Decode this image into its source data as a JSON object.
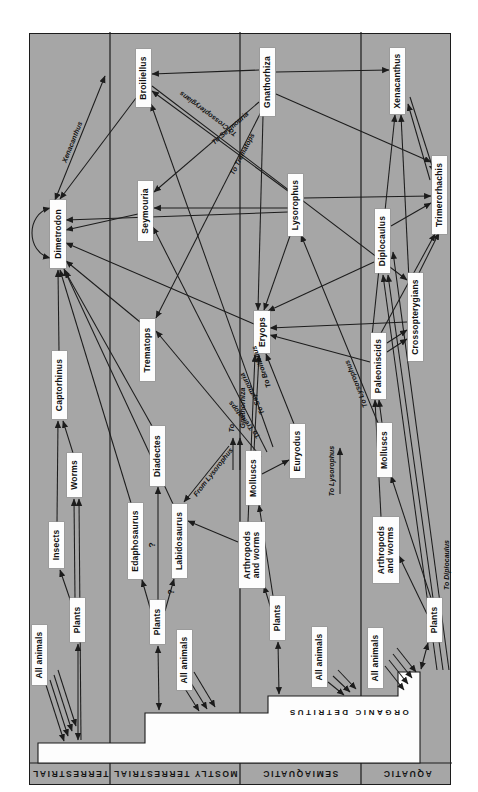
{
  "figure": {
    "detritus_label": "ORGANIC DETRITUS",
    "bands": [
      {
        "id": "terrestrial",
        "label": "TERRESTRIAL"
      },
      {
        "id": "mostly_terrestrial",
        "label": "MOSTLY TERRESTRIAL"
      },
      {
        "id": "semiaquatic",
        "label": "SEMIAQUATIC"
      },
      {
        "id": "aquatic",
        "label": "AQUATIC"
      }
    ]
  },
  "nodes": {
    "all_animals_t": {
      "label": "All animals",
      "zone": "terrestrial"
    },
    "plants_t": {
      "label": "Plants",
      "zone": "terrestrial"
    },
    "insects": {
      "label": "Insects",
      "zone": "terrestrial"
    },
    "worms": {
      "label": "Worms",
      "zone": "terrestrial"
    },
    "captorhinus": {
      "label": "Captorhinus",
      "zone": "terrestrial"
    },
    "dimetrodon": {
      "label": "Dimetrodon",
      "zone": "terrestrial"
    },
    "all_animals_mt": {
      "label": "All animals",
      "zone": "mostly_terrestrial"
    },
    "plants_mt": {
      "label": "Plants",
      "zone": "mostly_terrestrial"
    },
    "edaphosaurus": {
      "label": "Edaphosaurus",
      "zone": "mostly_terrestrial"
    },
    "labidosaurus": {
      "label": "Labidosaurus",
      "zone": "mostly_terrestrial"
    },
    "diadectes": {
      "label": "Diadectes",
      "zone": "mostly_terrestrial"
    },
    "trematops": {
      "label": "Trematops",
      "zone": "mostly_terrestrial"
    },
    "seymouria": {
      "label": "Seymouria",
      "zone": "mostly_terrestrial"
    },
    "broiliellus": {
      "label": "Broiliellus",
      "zone": "mostly_terrestrial"
    },
    "all_animals_s": {
      "label": "All animals",
      "zone": "semiaquatic"
    },
    "plants_s": {
      "label": "Plants",
      "zone": "semiaquatic"
    },
    "arthropods_s": {
      "label": "Arthropods and worms",
      "zone": "semiaquatic"
    },
    "molluscs_s": {
      "label": "Molluscs",
      "zone": "semiaquatic"
    },
    "euryodus": {
      "label": "Euryodus",
      "zone": "semiaquatic"
    },
    "eryops": {
      "label": "Eryops",
      "zone": "semiaquatic"
    },
    "lysorophus": {
      "label": "Lysorophus",
      "zone": "semiaquatic"
    },
    "gnathorhiza": {
      "label": "Gnathorhiza",
      "zone": "semiaquatic"
    },
    "all_animals_a": {
      "label": "All animals",
      "zone": "aquatic"
    },
    "plants_a": {
      "label": "Plants",
      "zone": "aquatic"
    },
    "arthropods_a": {
      "label": "Arthropods and worms",
      "zone": "aquatic"
    },
    "molluscs_a": {
      "label": "Molluscs",
      "zone": "aquatic"
    },
    "paleoniscids": {
      "label": "Paleoniscids",
      "zone": "aquatic"
    },
    "crossopterygians": {
      "label": "Crossopterygians",
      "zone": "aquatic"
    },
    "diplocaulus": {
      "label": "Diplocaulus",
      "zone": "aquatic"
    },
    "trimerorhachis": {
      "label": "Trimerorhachis",
      "zone": "aquatic"
    },
    "xenacanthus_a": {
      "label": "Xenacanthus",
      "zone": "aquatic"
    }
  },
  "edge_labels": {
    "xenacanthus_stub": "Xenacanthus",
    "to_crossopterygians": "To Crossopterygians",
    "to_seymouria_upper": "To Seymouria",
    "to_trematops_upper": "To Trematops",
    "to_trematops_lower": "To Trematops",
    "to_seymouria_lower": "To Seymouria",
    "to_broiliellus": "To Broiliellus",
    "to_gnathorhiza_line1": "To",
    "to_gnathorhiza_line2": "Gnathorhiza",
    "from_lysorophus": "From Lysorophus",
    "to_lysorophus_h": "To Lysorophus",
    "to_lysorophus_d": "To Lysorophus",
    "to_diplocaulus": "To Diplocaulus",
    "q1": "?",
    "q2": "?"
  },
  "edges": [
    {
      "from": "all_animals_t",
      "to": "detritus"
    },
    {
      "from": "detritus",
      "to": "plants_t",
      "double": true
    },
    {
      "from": "plants_t",
      "to": "insects"
    },
    {
      "from": "plants_t",
      "to": "worms"
    },
    {
      "from": "detritus",
      "to": "worms"
    },
    {
      "from": "insects",
      "to": "captorhinus"
    },
    {
      "from": "worms",
      "to": "captorhinus"
    },
    {
      "from": "captorhinus",
      "to": "dimetrodon"
    },
    {
      "from": "dimetrodon",
      "to": "dimetrodon"
    },
    {
      "from": "edaphosaurus",
      "to": "dimetrodon"
    },
    {
      "from": "labidosaurus",
      "to": "dimetrodon"
    },
    {
      "from": "diadectes",
      "to": "dimetrodon"
    },
    {
      "from": "trematops",
      "to": "dimetrodon"
    },
    {
      "from": "seymouria",
      "to": "dimetrodon"
    },
    {
      "from": "broiliellus",
      "to": "dimetrodon"
    },
    {
      "from": "eryops",
      "to": "dimetrodon"
    },
    {
      "from": "lysorophus",
      "to": "dimetrodon"
    },
    {
      "from": "dimetrodon",
      "to": "xenacanthus_a",
      "double": true,
      "label": "xenacanthus_stub"
    },
    {
      "from": "all_animals_mt",
      "to": "detritus"
    },
    {
      "from": "detritus",
      "to": "plants_mt",
      "double": true
    },
    {
      "from": "plants_mt",
      "to": "edaphosaurus"
    },
    {
      "from": "plants_mt",
      "to": "labidosaurus",
      "uncertain": true
    },
    {
      "from": "plants_mt",
      "to": "diadectes",
      "uncertain": true
    },
    {
      "from": "arthropods_s",
      "to": "labidosaurus"
    },
    {
      "from": "lysorophus",
      "to": "labidosaurus",
      "label": "from_lysorophus"
    },
    {
      "from": "gnathorhiza",
      "to": "broiliellus"
    },
    {
      "from": "gnathorhiza",
      "to": "seymouria",
      "label": "to_seymouria_upper"
    },
    {
      "from": "gnathorhiza",
      "to": "trematops",
      "label": "to_trematops_upper"
    },
    {
      "from": "broiliellus",
      "to": "crossopterygians",
      "label": "to_crossopterygians"
    },
    {
      "from": "molluscs_s",
      "to": "trematops",
      "label": "to_trematops_lower"
    },
    {
      "from": "molluscs_s",
      "to": "seymouria",
      "label": "to_seymouria_lower"
    },
    {
      "from": "molluscs_s",
      "to": "broiliellus",
      "label": "to_broiliellus"
    },
    {
      "from": "lysorophus",
      "to": "seymouria"
    },
    {
      "from": "lysorophus",
      "to": "broiliellus"
    },
    {
      "from": "all_animals_s",
      "to": "detritus"
    },
    {
      "from": "detritus",
      "to": "plants_s",
      "double": true
    },
    {
      "from": "plants_s",
      "to": "arthropods_s"
    },
    {
      "from": "plants_s",
      "to": "molluscs_s"
    },
    {
      "from": "molluscs_s",
      "to": "gnathorhiza",
      "label": "to_gnathorhiza_line2"
    },
    {
      "from": "molluscs_s",
      "to": "euryodus"
    },
    {
      "from": "molluscs_s",
      "to": "eryops"
    },
    {
      "from": "euryodus",
      "to": "eryops"
    },
    {
      "from": "arthropods_s",
      "to": "eryops"
    },
    {
      "from": "lysorophus",
      "to": "eryops"
    },
    {
      "from": "gnathorhiza",
      "to": "eryops"
    },
    {
      "from": "plants_s",
      "to": "lysorophus",
      "label": "to_lysorophus_h"
    },
    {
      "from": "molluscs_a",
      "to": "lysorophus",
      "label": "to_lysorophus_d"
    },
    {
      "from": "lysorophus",
      "to": "trimerorhachis"
    },
    {
      "from": "gnathorhiza",
      "to": "trimerorhachis"
    },
    {
      "from": "gnathorhiza",
      "to": "xenacanthus_a"
    },
    {
      "from": "all_animals_a",
      "to": "detritus"
    },
    {
      "from": "detritus",
      "to": "plants_a",
      "double": true
    },
    {
      "from": "plants_a",
      "to": "arthropods_a"
    },
    {
      "from": "plants_a",
      "to": "molluscs_a"
    },
    {
      "from": "detritus",
      "to": "diplocaulus",
      "label": "to_diplocaulus"
    },
    {
      "from": "arthropods_a",
      "to": "paleoniscids"
    },
    {
      "from": "molluscs_a",
      "to": "paleoniscids"
    },
    {
      "from": "paleoniscids",
      "to": "crossopterygians"
    },
    {
      "from": "paleoniscids",
      "to": "trimerorhachis"
    },
    {
      "from": "paleoniscids",
      "to": "xenacanthus_a"
    },
    {
      "from": "paleoniscids",
      "to": "eryops"
    },
    {
      "from": "crossopterygians",
      "to": "trimerorhachis"
    },
    {
      "from": "crossopterygians",
      "to": "xenacanthus_a"
    },
    {
      "from": "crossopterygians",
      "to": "eryops"
    },
    {
      "from": "diplocaulus",
      "to": "trimerorhachis"
    },
    {
      "from": "diplocaulus",
      "to": "eryops"
    },
    {
      "from": "trimerorhachis",
      "to": "xenacanthus_a",
      "double": true
    }
  ],
  "colors": {
    "background": "#ffffff",
    "panel": "#a6a6a6",
    "line": "#1c1c1c",
    "box_bg": "#fdfdfd",
    "text": "#111111"
  }
}
